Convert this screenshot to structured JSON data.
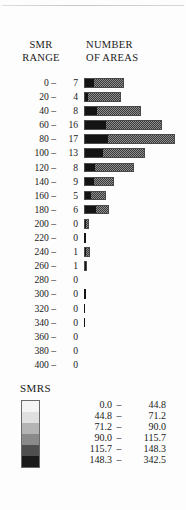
{
  "headers": {
    "smr_range_line1": "SMR",
    "smr_range_line2": "RANGE",
    "number_line1": "NUMBER",
    "number_line2": "OF AREAS"
  },
  "legend": {
    "title": "SMRS",
    "entries": [
      {
        "low": "0.0",
        "dash": "–",
        "high": "44.8",
        "color": "#f4f4f4"
      },
      {
        "low": "44.8",
        "dash": "–",
        "high": "71.2",
        "color": "#e0e0e0"
      },
      {
        "low": "71.2",
        "dash": "–",
        "high": "90.0",
        "color": "#b4b4b4"
      },
      {
        "low": "90.0",
        "dash": "–",
        "high": "115.7",
        "color": "#8a8a8a"
      },
      {
        "low": "115.7",
        "dash": "–",
        "high": "148.3",
        "color": "#4f4f4f"
      },
      {
        "low": "148.3",
        "dash": "–",
        "high": "342.5",
        "color": "#1b1b1b"
      }
    ]
  },
  "chart_data": {
    "type": "bar",
    "title": "NUMBER OF AREAS",
    "xlabel": "NUMBER OF AREAS",
    "ylabel": "SMR RANGE",
    "orientation": "horizontal",
    "grid": false,
    "legend_position": "bottom-left",
    "xlim": [
      0,
      17
    ],
    "categories": [
      "0 –",
      "20 –",
      "40 –",
      "60 –",
      "80 –",
      "100 –",
      "120 –",
      "140 –",
      "160 –",
      "180 –",
      "200 –",
      "220 –",
      "240 –",
      "260 –",
      "280 –",
      "300 –",
      "320 –",
      "340 –",
      "360 –",
      "380 –",
      "400 –"
    ],
    "values": [
      7,
      4,
      8,
      16,
      17,
      13,
      8,
      9,
      5,
      6,
      0,
      0,
      1,
      1,
      0,
      0,
      0,
      0,
      0,
      0,
      0
    ],
    "rows": [
      {
        "range": "0 –",
        "count": "7",
        "value": 7,
        "bar_px": 40,
        "dark_px": 9
      },
      {
        "range": "20 –",
        "count": "4",
        "value": 4,
        "bar_px": 37,
        "dark_px": 3
      },
      {
        "range": "40 –",
        "count": "8",
        "value": 8,
        "bar_px": 57,
        "dark_px": 12
      },
      {
        "range": "60 –",
        "count": "16",
        "value": 16,
        "bar_px": 78,
        "dark_px": 21
      },
      {
        "range": "80 –",
        "count": "17",
        "value": 17,
        "bar_px": 91,
        "dark_px": 23
      },
      {
        "range": "100 –",
        "count": "13",
        "value": 13,
        "bar_px": 61,
        "dark_px": 18
      },
      {
        "range": "120 –",
        "count": "8",
        "value": 8,
        "bar_px": 50,
        "dark_px": 10
      },
      {
        "range": "140 –",
        "count": "9",
        "value": 9,
        "bar_px": 30,
        "dark_px": 9
      },
      {
        "range": "160 –",
        "count": "5",
        "value": 5,
        "bar_px": 22,
        "dark_px": 6
      },
      {
        "range": "180 –",
        "count": "6",
        "value": 6,
        "bar_px": 25,
        "dark_px": 11
      },
      {
        "range": "200 –",
        "count": "0",
        "value": 0,
        "bar_px": 5,
        "dark_px": 1
      },
      {
        "range": "220 –",
        "count": "0",
        "value": 0,
        "bar_px": 2,
        "dark_px": 2
      },
      {
        "range": "240 –",
        "count": "1",
        "value": 1,
        "bar_px": 6,
        "dark_px": 1
      },
      {
        "range": "260 –",
        "count": "1",
        "value": 1,
        "bar_px": 3,
        "dark_px": 3
      },
      {
        "range": "280 –",
        "count": "0",
        "value": 0,
        "bar_px": 0,
        "dark_px": 0
      },
      {
        "range": "300 –",
        "count": "0",
        "value": 0,
        "bar_px": 2,
        "dark_px": 2
      },
      {
        "range": "320 –",
        "count": "0",
        "value": 0,
        "bar_px": 1,
        "dark_px": 1
      },
      {
        "range": "340 –",
        "count": "0",
        "value": 0,
        "bar_px": 1,
        "dark_px": 1
      },
      {
        "range": "360 –",
        "count": "0",
        "value": 0,
        "bar_px": 0,
        "dark_px": 0
      },
      {
        "range": "380 –",
        "count": "0",
        "value": 0,
        "bar_px": 0,
        "dark_px": 0
      },
      {
        "range": "400 –",
        "count": "0",
        "value": 0,
        "bar_px": 0,
        "dark_px": 0
      }
    ]
  }
}
